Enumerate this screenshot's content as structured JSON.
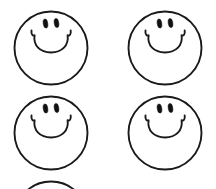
{
  "artwork": {
    "title": "Smiley Face Pattern",
    "description": "Hand-drawn outline smiley faces arranged in a grid",
    "background_color": "#ffffff",
    "line_color": "#1a1a1a",
    "eye_color": "#111111",
    "canvas": {
      "width": 216,
      "height": 189
    },
    "grid": {
      "columns": 2,
      "full_rows": 2,
      "partial_rows": 1
    },
    "stroke_width": 1.9,
    "faces": [
      {
        "id": "face-row1-col1",
        "label": "Smiley face top left",
        "cx": 51,
        "cy": 48,
        "r": 36.5,
        "clipped": false,
        "expression": "smile",
        "eyes": [
          {
            "cx": 45.5,
            "cy": 23.5,
            "rx": 2.3,
            "ry": 4.6,
            "rotate": -8
          },
          {
            "cx": 56.5,
            "cy": 23.0,
            "rx": 2.3,
            "ry": 4.6,
            "rotate": -8
          }
        ],
        "mouth_path": "M 31.5 30.5 C 31.0 34.5 32.8 36.4 34.6 35.2 C 33.0 45.5 40.0 52.5 51.0 52.5 C 62.0 52.5 69.0 45.5 67.6 35.2 C 69.4 36.4 71.2 34.5 70.7 30.5"
      },
      {
        "id": "face-row1-col2",
        "label": "Smiley face top right",
        "cx": 165,
        "cy": 48,
        "r": 36.5,
        "clipped": false,
        "expression": "smile",
        "eyes": [
          {
            "cx": 159.5,
            "cy": 23.5,
            "rx": 2.3,
            "ry": 4.6,
            "rotate": -8
          },
          {
            "cx": 170.5,
            "cy": 23.0,
            "rx": 2.3,
            "ry": 4.6,
            "rotate": -8
          }
        ],
        "mouth_path": "M 145.5 30.5 C 145.0 34.5 146.8 36.4 148.6 35.2 C 147.0 45.5 154.0 52.5 165.0 52.5 C 176.0 52.5 183.0 45.5 181.6 35.2 C 183.4 36.4 185.2 34.5 184.7 30.5"
      },
      {
        "id": "face-row2-col1",
        "label": "Smiley face middle left",
        "cx": 51,
        "cy": 133,
        "r": 36.5,
        "clipped": false,
        "expression": "smile",
        "eyes": [
          {
            "cx": 45.5,
            "cy": 108.5,
            "rx": 2.3,
            "ry": 4.6,
            "rotate": -8
          },
          {
            "cx": 56.5,
            "cy": 108.0,
            "rx": 2.3,
            "ry": 4.6,
            "rotate": -8
          }
        ],
        "mouth_path": "M 31.5 115.5 C 31.0 119.5 32.8 121.4 34.6 120.2 C 33.0 130.5 40.0 137.5 51.0 137.5 C 62.0 137.5 69.0 130.5 67.6 120.2 C 69.4 121.4 71.2 119.5 70.7 115.5"
      },
      {
        "id": "face-row2-col2",
        "label": "Smiley face middle right",
        "cx": 165,
        "cy": 133,
        "r": 36.5,
        "clipped": false,
        "expression": "smile",
        "eyes": [
          {
            "cx": 159.5,
            "cy": 108.5,
            "rx": 2.3,
            "ry": 4.6,
            "rotate": -8
          },
          {
            "cx": 170.5,
            "cy": 108.0,
            "rx": 2.3,
            "ry": 4.6,
            "rotate": -8
          }
        ],
        "mouth_path": "M 145.5 115.5 C 145.0 119.5 146.8 121.4 148.6 120.2 C 147.0 130.5 154.0 137.5 165.0 137.5 C 176.0 137.5 183.0 130.5 181.6 120.2 C 183.4 121.4 185.2 119.5 184.7 115.5"
      },
      {
        "id": "face-row3-col1",
        "label": "Smiley face bottom left (cut off by image edge)",
        "cx": 51,
        "cy": 218,
        "r": 36.5,
        "clipped": true,
        "expression": "smile",
        "eyes": [],
        "mouth_path": ""
      }
    ]
  }
}
